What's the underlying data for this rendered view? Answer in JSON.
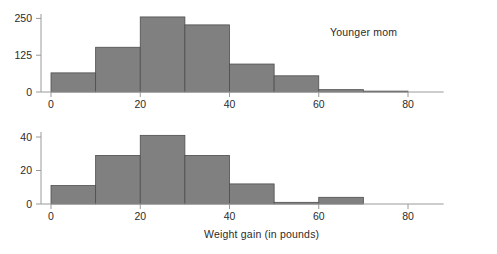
{
  "figure": {
    "xlabel": "Weight gain (in pounds)",
    "bar_fill": "#808080",
    "bar_edge": "#4d4d4d",
    "axis_color": "#9a9a9a",
    "background": "#ffffff"
  },
  "chart_data": [
    {
      "type": "bar",
      "title": "Younger mom",
      "xlabel": "Weight gain (in pounds)",
      "ylabel": "",
      "bin_width": 10,
      "bin_edges": [
        0,
        10,
        20,
        30,
        40,
        50,
        60,
        70,
        80
      ],
      "categories": [
        "0-10",
        "10-20",
        "20-30",
        "30-40",
        "40-50",
        "50-60",
        "60-70",
        "70-80"
      ],
      "values": [
        65,
        152,
        255,
        228,
        95,
        55,
        8,
        3
      ],
      "xlim": [
        -3,
        88
      ],
      "ylim": [
        0,
        265
      ],
      "xticks": [
        0,
        20,
        40,
        60,
        80
      ],
      "xticklabels": [
        "0",
        "20",
        "40",
        "60",
        "80"
      ],
      "yticks": [
        0,
        125,
        250
      ],
      "yticklabels": [
        "0",
        "125",
        "250"
      ],
      "grid": false,
      "legend": "none"
    },
    {
      "type": "bar",
      "title": "Mature mom",
      "xlabel": "Weight gain (in pounds)",
      "ylabel": "",
      "bin_width": 10,
      "bin_edges": [
        0,
        10,
        20,
        30,
        40,
        50,
        60,
        70
      ],
      "categories": [
        "0-10",
        "10-20",
        "20-30",
        "30-40",
        "40-50",
        "50-60",
        "60-70"
      ],
      "values": [
        11,
        29,
        41,
        29,
        12,
        1,
        4
      ],
      "xlim": [
        -3,
        88
      ],
      "ylim": [
        0,
        43
      ],
      "xticks": [
        0,
        20,
        40,
        60,
        80
      ],
      "xticklabels": [
        "0",
        "20",
        "40",
        "60",
        "80"
      ],
      "yticks": [
        0,
        20,
        40
      ],
      "yticklabels": [
        "0",
        "20",
        "40"
      ],
      "grid": false,
      "legend": "none"
    }
  ]
}
